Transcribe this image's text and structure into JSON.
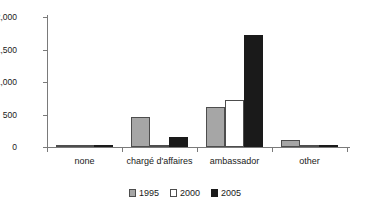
{
  "chart_data": {
    "type": "bar",
    "title": "",
    "subtitle": "",
    "xlabel": "",
    "ylabel": "",
    "categories": [
      "none",
      "chargé d'affaires",
      "ambassador",
      "other"
    ],
    "series": [
      {
        "name": "1995",
        "color": "#a6a6a6",
        "values": [
          15,
          460,
          610,
          110
        ]
      },
      {
        "name": "2000",
        "color": "#ffffff",
        "values": [
          10,
          10,
          730,
          30
        ]
      },
      {
        "name": "2005",
        "color": "#1a1a1a",
        "values": [
          20,
          150,
          1730,
          5
        ]
      }
    ],
    "ylim": [
      0,
      2000
    ],
    "yticks": [
      0,
      500,
      1000,
      1500,
      2000
    ],
    "ytick_labels": [
      "0",
      "500",
      "1,000",
      "1,500",
      "2,000"
    ],
    "grid": false,
    "legend_position": "bottom-center",
    "frame": "left-bottom"
  },
  "axis": {
    "line_color": "#7a7a7a",
    "tick_0": "0",
    "tick_1": "500",
    "tick_2": "1,000",
    "tick_3": "1,500",
    "tick_4": "2,000"
  },
  "categories": {
    "c0": "none",
    "c1": "chargé d'affaires",
    "c2": "ambassador",
    "c3": "other"
  },
  "legend": {
    "i0": "1995",
    "i1": "2000",
    "i2": "2005"
  }
}
